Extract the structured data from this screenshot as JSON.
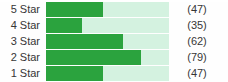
{
  "chart_data": {
    "type": "bar",
    "orientation": "horizontal",
    "title": "",
    "xlabel": "",
    "ylabel": "",
    "grid": false,
    "legend": null,
    "categories": [
      "5 Star",
      "4 Star",
      "3 Star",
      "2 Star",
      "1 Star"
    ],
    "values": [
      47,
      35,
      62,
      79,
      47
    ],
    "value_labels": [
      "(47)",
      "(35)",
      "(62)",
      "(79)",
      "(47)"
    ],
    "xlim": [
      0,
      102
    ],
    "max_value": 79,
    "colors": {
      "bar_fill": "#2ba33e",
      "bar_track": "#d4f2e0",
      "text": "#363636",
      "background": "#fefefe"
    }
  },
  "rows": [
    {
      "label": "5 Star",
      "count": 47,
      "count_label": "(47)",
      "fill_percent": 46.1
    },
    {
      "label": "4 Star",
      "count": 35,
      "count_label": "(35)",
      "fill_percent": 29.3
    },
    {
      "label": "3 Star",
      "count": 62,
      "count_label": "(62)",
      "fill_percent": 62.6
    },
    {
      "label": "2 Star",
      "count": 79,
      "count_label": "(79)",
      "fill_percent": 77.2
    },
    {
      "label": "1 Star",
      "count": 47,
      "count_label": "(47)",
      "fill_percent": 46.1
    }
  ]
}
